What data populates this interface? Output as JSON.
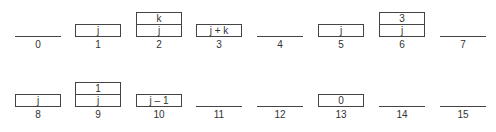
{
  "diagram": {
    "rows": [
      {
        "cells": [
          {
            "index": "0",
            "stack": []
          },
          {
            "index": "1",
            "stack": [
              "j"
            ]
          },
          {
            "index": "2",
            "stack": [
              "k",
              "j"
            ]
          },
          {
            "index": "3",
            "stack": [
              "j + k"
            ]
          },
          {
            "index": "4",
            "stack": []
          },
          {
            "index": "5",
            "stack": [
              "j"
            ]
          },
          {
            "index": "6",
            "stack": [
              "3",
              "j"
            ]
          },
          {
            "index": "7",
            "stack": []
          }
        ]
      },
      {
        "cells": [
          {
            "index": "8",
            "stack": [
              "j"
            ]
          },
          {
            "index": "9",
            "stack": [
              "1",
              "j"
            ]
          },
          {
            "index": "10",
            "stack": [
              "j – 1"
            ]
          },
          {
            "index": "11",
            "stack": []
          },
          {
            "index": "12",
            "stack": []
          },
          {
            "index": "13",
            "stack": [
              "0"
            ]
          },
          {
            "index": "14",
            "stack": []
          },
          {
            "index": "15",
            "stack": []
          }
        ]
      }
    ]
  }
}
